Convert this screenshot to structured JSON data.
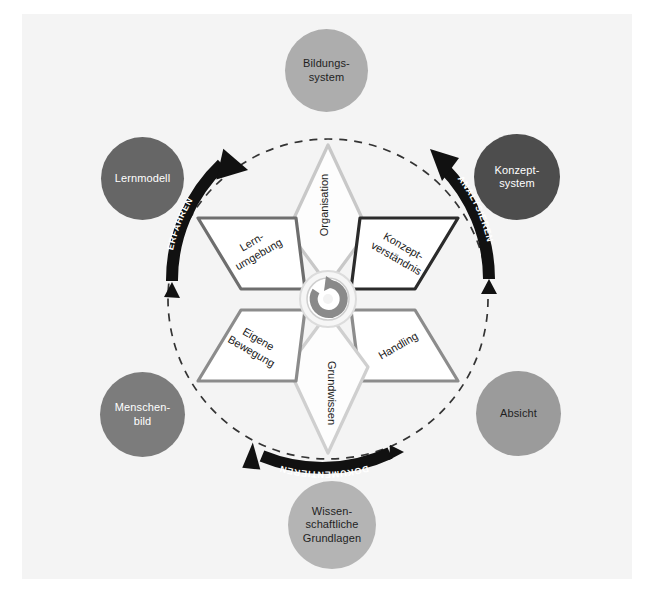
{
  "diagram": {
    "background_color": "#f4f4f4",
    "page_color": "#ffffff"
  },
  "center": {
    "icon": "circular-arrow-icon",
    "label": ""
  },
  "petals": [
    {
      "id": "organisation",
      "label": "Organisation",
      "border_color": "#c8c8c8",
      "fill": "#fdfdfd",
      "position": "top"
    },
    {
      "id": "konzeptverstaendnis",
      "label": "Konzept-\nverständnis",
      "border_color": "#2b2b2b",
      "fill": "#ffffff",
      "position": "upper-right"
    },
    {
      "id": "handling",
      "label": "Handling",
      "border_color": "#8c8c8c",
      "fill": "#ffffff",
      "position": "lower-right"
    },
    {
      "id": "grundwissen",
      "label": "Grundwissen",
      "border_color": "#cfcfcf",
      "fill": "#fdfdfd",
      "position": "bottom"
    },
    {
      "id": "eigene-bewegung",
      "label": "Eigene\nBewegung",
      "border_color": "#8c8c8c",
      "fill": "#ffffff",
      "position": "lower-left"
    },
    {
      "id": "lernumgebung",
      "label": "Lern-\numgebung",
      "border_color": "#6e6e6e",
      "fill": "#ffffff",
      "position": "upper-left"
    }
  ],
  "process_arrows": [
    {
      "id": "erfahren",
      "label": "ERFAHREN",
      "color": "#111111",
      "position": "upper-left"
    },
    {
      "id": "analysieren",
      "label": "ANALYSIEREN",
      "color": "#111111",
      "position": "upper-right"
    },
    {
      "id": "dokumentieren",
      "label": "DOKUMENTIEREN",
      "color": "#111111",
      "position": "bottom"
    }
  ],
  "context_circles": [
    {
      "id": "bildungssystem",
      "line1": "Bildungs-",
      "line2": "system",
      "line3": "",
      "fill": "#adadad",
      "text_color": "#1f1f1f"
    },
    {
      "id": "lernmodell",
      "line1": "Lernmodell",
      "line2": "",
      "line3": "",
      "fill": "#666666",
      "text_color": "#ffffff"
    },
    {
      "id": "konzeptsystem",
      "line1": "Konzept-",
      "line2": "system",
      "line3": "",
      "fill": "#4d4d4d",
      "text_color": "#ffffff"
    },
    {
      "id": "menschenbild",
      "line1": "Menschen-",
      "line2": "bild",
      "line3": "",
      "fill": "#7c7c7c",
      "text_color": "#ffffff"
    },
    {
      "id": "absicht",
      "line1": "Absicht",
      "line2": "",
      "line3": "",
      "fill": "#9b9b9b",
      "text_color": "#1f1f1f"
    },
    {
      "id": "wissenschaftliche-grundlagen",
      "line1": "Wissen-",
      "line2": "schaftliche",
      "line3": "Grundlagen",
      "fill": "#b4b4b4",
      "text_color": "#1f1f1f"
    }
  ],
  "ring": {
    "style": "dashed",
    "color": "#333333"
  }
}
